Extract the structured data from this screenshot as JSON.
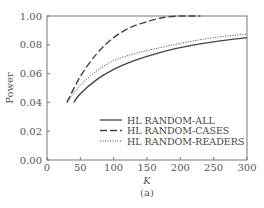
{
  "chart_data": {
    "type": "line",
    "title": "",
    "caption": "(a)",
    "xlabel": "K",
    "ylabel": "Power",
    "xlim": [
      0,
      300
    ],
    "ylim": [
      0.0,
      0.1
    ],
    "x_ticks": [
      "0",
      "50",
      "100",
      "150",
      "200",
      "250",
      "300"
    ],
    "y_ticks": [
      "0.00",
      "0.02",
      "0.04",
      "0.06",
      "0.08",
      "1.00"
    ],
    "grid": false,
    "legend_position": "lower right",
    "series": [
      {
        "name": "HL RANDOM-ALL",
        "style": "solid",
        "x": [
          40,
          50,
          75,
          100,
          125,
          150,
          200,
          250,
          300
        ],
        "y": [
          0.04,
          0.046,
          0.056,
          0.063,
          0.068,
          0.072,
          0.078,
          0.082,
          0.085
        ]
      },
      {
        "name": "HL RANDOM-CASES",
        "style": "dashed",
        "x": [
          30,
          50,
          75,
          100,
          125,
          150,
          175,
          200
        ],
        "y": [
          0.04,
          0.058,
          0.074,
          0.085,
          0.092,
          0.096,
          0.099,
          0.1
        ]
      },
      {
        "name": "HL RANDOM-READERS",
        "style": "dotted",
        "x": [
          30,
          50,
          75,
          100,
          125,
          150,
          200,
          250,
          300
        ],
        "y": [
          0.04,
          0.052,
          0.062,
          0.069,
          0.073,
          0.076,
          0.081,
          0.085,
          0.0875
        ]
      }
    ]
  }
}
